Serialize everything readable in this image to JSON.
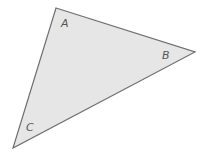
{
  "diagram": {
    "type": "triangle",
    "fill_color": "#e6e6e6",
    "stroke_color": "#6e6e6e",
    "vertices": [
      {
        "name": "A",
        "x": 56,
        "y": 8,
        "label": "A",
        "label_x": 61,
        "label_y": 27
      },
      {
        "name": "B",
        "x": 195,
        "y": 52,
        "label": "B",
        "label_x": 162,
        "label_y": 59
      },
      {
        "name": "C",
        "x": 13,
        "y": 148,
        "label": "C",
        "label_x": 26,
        "label_y": 131
      }
    ]
  }
}
